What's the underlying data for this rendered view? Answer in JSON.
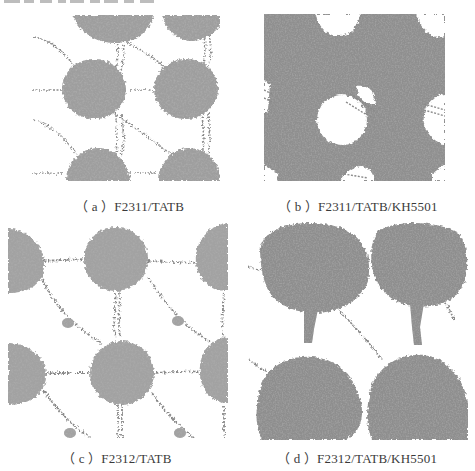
{
  "figure": {
    "panels": [
      {
        "id": "a",
        "label": "a",
        "caption": "F2311/TATB",
        "description": "Separated spherical polymer aggregates linked by chain filaments"
      },
      {
        "id": "b",
        "label": "b",
        "caption": "F2311/TATB/KH5501",
        "description": "Continuous polymer network with circular voids"
      },
      {
        "id": "c",
        "label": "c",
        "caption": "F2312/TATB",
        "description": "Spherical aggregates bridged by thin chains"
      },
      {
        "id": "d",
        "label": "d",
        "caption": "F2312/TATB/KH5501",
        "description": "Large dense aggregates connected by necks"
      }
    ],
    "captions": {
      "a": "（ a ）F2311/TATB",
      "b": "（ b ）F2311/TATB/KH5501",
      "c": "（ c ）F2312/TATB",
      "d": "（ d ）F2312/TATB/KH5501"
    },
    "colors": {
      "background": "#ffffff",
      "blob_light": "#a8a8a8",
      "blob_dark": "#6a6a6a",
      "chain": "#8a8a8a",
      "text": "#3a3a3a"
    }
  }
}
